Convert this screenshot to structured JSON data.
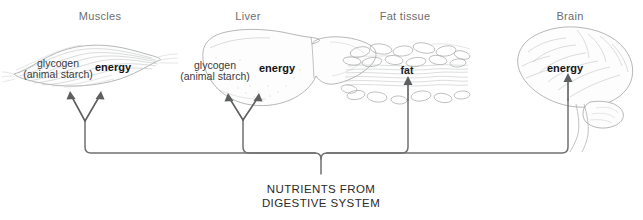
{
  "diagram": {
    "caption": {
      "line1": "NUTRIENTS FROM",
      "line2": "DIGESTIVE SYSTEM"
    },
    "colors": {
      "title_text": "#6d6e70",
      "body_text": "#3b3b3c",
      "emphasis_text": "#151515",
      "connector_line": "#6f7072",
      "illustration_line": "#9a9b9d",
      "background": "#ffffff"
    },
    "targets": [
      {
        "id": "muscles",
        "title": "Muscles",
        "title_x": 100,
        "title_y": 10,
        "illustration": "muscle-spindle",
        "labels": [
          {
            "kind": "storage",
            "line1": "glycogen",
            "line2": "(animal starch)",
            "x": 58,
            "y": 58
          },
          {
            "kind": "energy",
            "text": "energy",
            "x": 113,
            "y": 62
          }
        ],
        "arrow_count": 2
      },
      {
        "id": "liver",
        "title": "Liver",
        "title_x": 248,
        "title_y": 10,
        "illustration": "liver-lobes",
        "labels": [
          {
            "kind": "storage",
            "line1": "glycogen",
            "line2": "(animal starch)",
            "x": 215,
            "y": 60
          },
          {
            "kind": "energy",
            "text": "energy",
            "x": 277,
            "y": 63
          }
        ],
        "arrow_count": 2
      },
      {
        "id": "fat-tissue",
        "title": "Fat tissue",
        "title_x": 405,
        "title_y": 10,
        "illustration": "adipose-cells",
        "labels": [
          {
            "kind": "fat",
            "text": "fat",
            "x": 407,
            "y": 65
          }
        ],
        "arrow_count": 1
      },
      {
        "id": "brain",
        "title": "Brain",
        "title_x": 570,
        "title_y": 10,
        "illustration": "brain-lateral",
        "labels": [
          {
            "kind": "energy",
            "text": "energy",
            "x": 565,
            "y": 63
          }
        ],
        "arrow_count": 1
      }
    ]
  }
}
